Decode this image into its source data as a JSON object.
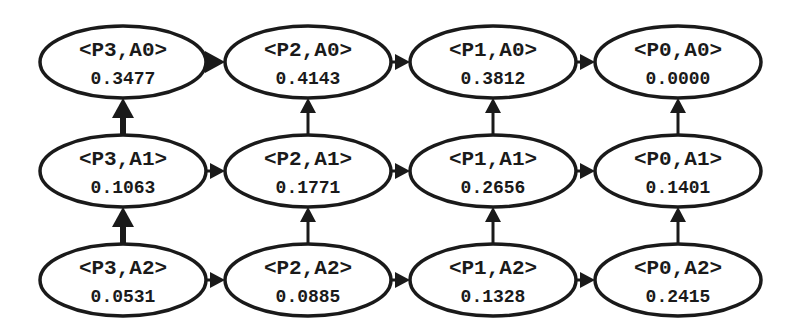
{
  "diagram": {
    "type": "grid-state-graph",
    "colors": {
      "stroke": "#1a1a1a",
      "fill": "#ffffff",
      "text": "#1a1a1a"
    },
    "nodes": [
      {
        "id": "P3A0",
        "label": "<P3,A0>",
        "value": "0.3477",
        "cx": 123,
        "cy": 62
      },
      {
        "id": "P2A0",
        "label": "<P2,A0>",
        "value": "0.4143",
        "cx": 308,
        "cy": 62
      },
      {
        "id": "P1A0",
        "label": "<P1,A0>",
        "value": "0.3812",
        "cx": 493,
        "cy": 62
      },
      {
        "id": "P0A0",
        "label": "<P0,A0>",
        "value": "0.0000",
        "cx": 678,
        "cy": 62
      },
      {
        "id": "P3A1",
        "label": "<P3,A1>",
        "value": "0.1063",
        "cx": 123,
        "cy": 171
      },
      {
        "id": "P2A1",
        "label": "<P2,A1>",
        "value": "0.1771",
        "cx": 308,
        "cy": 171
      },
      {
        "id": "P1A1",
        "label": "<P1,A1>",
        "value": "0.2656",
        "cx": 493,
        "cy": 171
      },
      {
        "id": "P0A1",
        "label": "<P0,A1>",
        "value": "0.1401",
        "cx": 678,
        "cy": 171
      },
      {
        "id": "P3A2",
        "label": "<P3,A2>",
        "value": "0.0531",
        "cx": 123,
        "cy": 280
      },
      {
        "id": "P2A2",
        "label": "<P2,A2>",
        "value": "0.0885",
        "cx": 308,
        "cy": 280
      },
      {
        "id": "P1A2",
        "label": "<P1,A2>",
        "value": "0.1328",
        "cx": 493,
        "cy": 280
      },
      {
        "id": "P0A2",
        "label": "<P0,A2>",
        "value": "0.2415",
        "cx": 678,
        "cy": 280
      }
    ],
    "edges": [
      {
        "from": "P3A0",
        "to": "P2A0",
        "bold": true
      },
      {
        "from": "P2A0",
        "to": "P1A0",
        "bold": false
      },
      {
        "from": "P1A0",
        "to": "P0A0",
        "bold": false
      },
      {
        "from": "P3A1",
        "to": "P2A1",
        "bold": false
      },
      {
        "from": "P2A1",
        "to": "P1A1",
        "bold": false
      },
      {
        "from": "P1A1",
        "to": "P0A1",
        "bold": false
      },
      {
        "from": "P3A2",
        "to": "P2A2",
        "bold": false
      },
      {
        "from": "P2A2",
        "to": "P1A2",
        "bold": false
      },
      {
        "from": "P1A2",
        "to": "P0A2",
        "bold": false
      },
      {
        "from": "P3A1",
        "to": "P3A0",
        "bold": true
      },
      {
        "from": "P3A2",
        "to": "P3A1",
        "bold": true
      },
      {
        "from": "P2A1",
        "to": "P2A0",
        "bold": false
      },
      {
        "from": "P2A2",
        "to": "P2A1",
        "bold": false
      },
      {
        "from": "P1A1",
        "to": "P1A0",
        "bold": false
      },
      {
        "from": "P1A2",
        "to": "P1A1",
        "bold": false
      },
      {
        "from": "P0A1",
        "to": "P0A0",
        "bold": false
      },
      {
        "from": "P0A2",
        "to": "P0A1",
        "bold": false
      }
    ]
  }
}
